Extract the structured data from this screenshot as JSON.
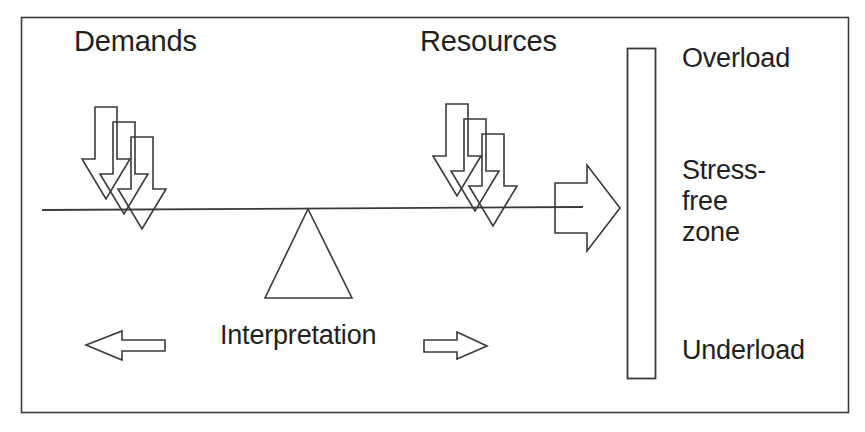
{
  "diagram": {
    "frame": {
      "name": "outer-border"
    },
    "labels": {
      "demands": "Demands",
      "resources": "Resources",
      "interpretation": "Interpretation",
      "overload": "Overload",
      "stress_free_zone": "Stress-\nfree\nzone",
      "underload": "Underload"
    },
    "colors": {
      "stroke": "#3a3a3a",
      "text": "#231f20",
      "background": "#ffffff"
    },
    "elements": {
      "balance_beam": "balance-beam",
      "fulcrum": "fulcrum-triangle",
      "demand_arrows_count": 3,
      "resource_arrows_count": 3,
      "pointer_arrow": "beam-pointer-arrow",
      "scale_bar": "stress-scale-bar",
      "left_arrow": "interpretation-left-arrow",
      "right_arrow": "interpretation-right-arrow"
    }
  }
}
